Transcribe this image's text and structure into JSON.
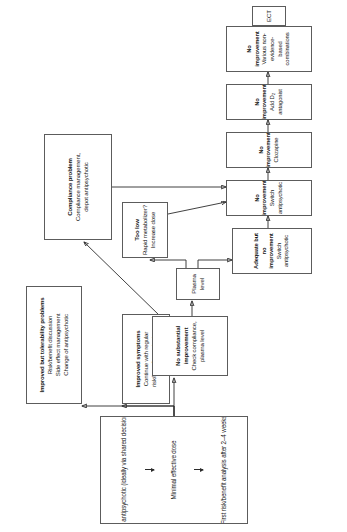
{
  "figure": {
    "type": "flowchart",
    "orientation": "rotated-90-ccw",
    "accent_color": "#2b2b2b",
    "border_color": "#5c5c5c",
    "background": "#ffffff"
  },
  "nodes": {
    "choice": {
      "name": "choice-of-antipsychotic",
      "lines": [
        "Choice of antipsychotic (ideally via shared decision making)",
        "Minimal effective dose",
        "First risk/benefit analysis after 2–4 weeks"
      ]
    },
    "improved_symptoms": {
      "name": "improved-symptoms",
      "title": "Improved symptoms",
      "lines": [
        "Continue with regular",
        "risk/benefit monitoring"
      ]
    },
    "tolerability": {
      "name": "improved-but-tolerability-problems",
      "title": "Improved but tolerability problems",
      "lines": [
        "Risk/benefit discussion",
        "Side effect management",
        "Change of antipsychotic"
      ]
    },
    "no_substantial": {
      "name": "no-substantial-improvement",
      "title": "No substantial improvement",
      "lines": [
        "Check compliance, plasma level"
      ]
    },
    "compliance": {
      "name": "compliance-problem",
      "title": "Compliance problem",
      "lines": [
        "Compliance management,",
        "depot antipsychotic"
      ]
    },
    "plasma_level": {
      "name": "plasma-level",
      "title": "",
      "lines": [
        "Plasma level"
      ]
    },
    "too_low": {
      "name": "too-low",
      "title": "Too low",
      "lines": [
        "Rapid metabolizer?",
        "Increase dose"
      ]
    },
    "adequate": {
      "name": "adequate-but-no-improvement",
      "title": "Adequate but no improvement",
      "lines": [
        "Switch antipsychotic"
      ]
    },
    "no_improve_switch": {
      "name": "no-improvement-switch-antipsychotic",
      "title": "No improvement",
      "lines": [
        "Switch antipsychotic"
      ]
    },
    "no_improve_cloz": {
      "name": "no-improvement-clozapine",
      "title": "No improvement",
      "lines": [
        "Clozapine"
      ]
    },
    "no_improve_d2": {
      "name": "no-improvement-add-d2-antagonist",
      "title": "No improvement",
      "lines": [
        "Add D",
        "antagonist"
      ],
      "subscript": "2"
    },
    "no_improve_various": {
      "name": "no-improvement-various-combinations",
      "title": "No improvement",
      "lines": [
        "Various non-evidence-based combinations"
      ]
    },
    "ect": {
      "name": "ect",
      "title": "",
      "lines": [
        "ECT"
      ]
    }
  }
}
